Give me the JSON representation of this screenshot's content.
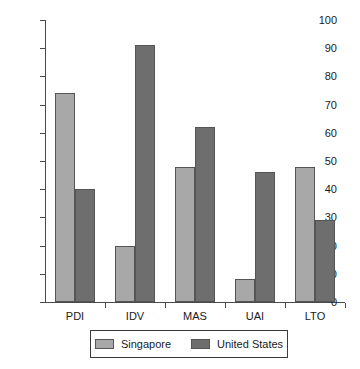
{
  "chart_data": {
    "type": "bar",
    "title": "",
    "subtitle": "",
    "xlabel": "",
    "ylabel": "",
    "categories": [
      "PDI",
      "IDV",
      "MAS",
      "UAI",
      "LTO"
    ],
    "series": [
      {
        "name": "Singapore",
        "color": "#a8a8a8",
        "values": [
          74,
          20,
          48,
          8,
          48
        ]
      },
      {
        "name": "United States",
        "color": "#6e6e6e",
        "values": [
          40,
          91,
          62,
          46,
          29
        ]
      }
    ],
    "ylim": [
      0,
      100
    ],
    "yticks": [
      0,
      10,
      20,
      30,
      40,
      50,
      60,
      70,
      80,
      90,
      100
    ],
    "ytick_labels": [
      "0",
      "10",
      "20",
      "30",
      "40",
      "50",
      "60",
      "70",
      "80",
      "90",
      "100"
    ],
    "grid": false,
    "legend_position": "bottom",
    "legend_entries": [
      "Singapore",
      "United States"
    ]
  },
  "colors": {
    "singapore": "#a8a8a8",
    "united_states": "#6e6e6e",
    "axis": "#4a4a4a",
    "bar_border": "#555555",
    "legend_border": "#3b3b3b",
    "text": "#1a1a1a",
    "background": "#ffffff"
  }
}
